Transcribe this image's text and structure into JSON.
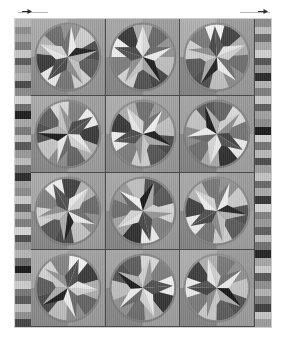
{
  "canvas": {
    "width": 286,
    "height": 346,
    "background": "#ffffff"
  },
  "markers": {
    "left": {
      "name": "scale-arrow-left",
      "x": 18,
      "y": 9,
      "width": 30,
      "color": "#2b2b2b",
      "rule_color": "#b8b8b8"
    },
    "right": {
      "name": "scale-arrow-right",
      "x": 240,
      "y": 9,
      "width": 30,
      "color": "#2b2b2b",
      "rule_color": "#b8b8b8"
    }
  },
  "quilt": {
    "label": "Star Medallion Quilt",
    "x": 14,
    "y": 18,
    "width": 258,
    "height": 310,
    "background": "#9a9a9a",
    "edge_color": "#cfcfcf",
    "sashing_color": "#4a4a4a",
    "rows": 4,
    "cols": 3,
    "border_width": 16,
    "border_left": {
      "name": "pieced-border-left",
      "segments": [
        "#b9b9b9",
        "#8e8e8e",
        "#a6a6a6",
        "#7c7c7c",
        "#c6c6c6",
        "#5c5c5c",
        "#9d9d9d",
        "#b0b0b0",
        "#4a4a4a",
        "#8a8a8a",
        "#d2d2d2",
        "#6e6e6e",
        "#1e1e1e",
        "#a8a8a8",
        "#7a7a7a",
        "#c0c0c0",
        "#575757",
        "#9a9a9a",
        "#bdbdbd",
        "#707070",
        "#2c2c2c",
        "#a0a0a0",
        "#8c8c8c",
        "#cacaca",
        "#636363",
        "#aeaeae",
        "#7f7f7f",
        "#d6d6d6",
        "#4f4f4f",
        "#959595",
        "#b6b6b6",
        "#6a6a6a",
        "#1a1a1a",
        "#a3a3a3",
        "#cdcdcd",
        "#787878",
        "#5a5a5a",
        "#bebebe",
        "#909090",
        "#454545"
      ]
    },
    "border_right": {
      "name": "pieced-border-right",
      "segments": [
        "#8b8b8b",
        "#bdbdbd",
        "#6c6c6c",
        "#a9a9a9",
        "#d0d0d0",
        "#545454",
        "#989898",
        "#2a2a2a",
        "#b4b4b4",
        "#7e7e7e",
        "#c8c8c8",
        "#606060",
        "#a1a1a1",
        "#8d8d8d",
        "#1c1c1c",
        "#cfcfcf",
        "#747474",
        "#b8b8b8",
        "#4c4c4c",
        "#9e9e9e",
        "#c3c3c3",
        "#686868",
        "#aaaaaa",
        "#363636",
        "#d4d4d4",
        "#828282",
        "#9494949",
        "#5f5f5f",
        "#bbbbbb",
        "#717171",
        "#242424",
        "#a6a6a6",
        "#cbcbcb",
        "#595959",
        "#8f8f8f",
        "#b2b2b2",
        "#7b7b7b",
        "#404040",
        "#c5c5c5",
        "#9c9c9c"
      ]
    },
    "blocks": [
      {
        "name": "star-block-r1c1",
        "quadrants": [
          "#a9a9a9",
          "#9d9d9d",
          "#8f8f8f",
          "#9a9a9a"
        ],
        "circle": "#a3a3a3",
        "ring": "#8a8a8a",
        "rotation": 6,
        "wedges": [
          "#5f5f5f",
          "#d9d9d9",
          "#7b7b7b",
          "#f2f2f2",
          "#3a3a3a",
          "#b4b4b4",
          "#6b6b6b",
          "#8f8f8f",
          "#cfcfcf",
          "#4c4c4c"
        ],
        "points": [
          "#6e6e6e",
          "#1f1f1f",
          "#c9c9c9",
          "#4a4a4a",
          "#ededed"
        ]
      },
      {
        "name": "star-block-r1c2",
        "quadrants": [
          "#a4a4a4",
          "#9a9a9a",
          "#8c8c8c",
          "#a0a0a0"
        ],
        "circle": "#a6a6a6",
        "ring": "#868686",
        "rotation": 72,
        "wedges": [
          "#555555",
          "#dcdcdc",
          "#808080",
          "#f4f4f4",
          "#333333",
          "#ababab",
          "#666666",
          "#949494",
          "#c4c4c4",
          "#474747"
        ],
        "points": [
          "#6a6a6a",
          "#1c1c1c",
          "#cccccc",
          "#4f4f4f",
          "#f0f0f0"
        ]
      },
      {
        "name": "star-block-r1c3",
        "quadrants": [
          "#adadad",
          "#989898",
          "#8a8a8a",
          "#9e9e9e"
        ],
        "circle": "#a1a1a1",
        "ring": "#8d8d8d",
        "rotation": 140,
        "wedges": [
          "#5b5b5b",
          "#d5d5d5",
          "#787878",
          "#f6f6f6",
          "#3d3d3d",
          "#b0b0b0",
          "#707070",
          "#909090",
          "#c8c8c8",
          "#515151"
        ],
        "points": [
          "#737373",
          "#222222",
          "#d0d0d0",
          "#454545",
          "#eaeaea"
        ]
      },
      {
        "name": "star-block-r2c1",
        "quadrants": [
          "#a6a6a6",
          "#9c9c9c",
          "#8e8e8e",
          "#a2a2a2"
        ],
        "circle": "#a8a8a8",
        "ring": "#888888",
        "rotation": 200,
        "wedges": [
          "#5d5d5d",
          "#dadada",
          "#7d7d7d",
          "#f1f1f1",
          "#383838",
          "#b6b6b6",
          "#696969",
          "#929292",
          "#cbcbcb",
          "#4e4e4e"
        ],
        "points": [
          "#6c6c6c",
          "#1a1a1a",
          "#c6c6c6",
          "#484848",
          "#efefef"
        ]
      },
      {
        "name": "star-block-r2c2",
        "quadrants": [
          "#aaaaaa",
          "#9f9f9f",
          "#909090",
          "#9b9b9b"
        ],
        "circle": "#a4a4a4",
        "ring": "#8b8b8b",
        "rotation": 40,
        "wedges": [
          "#585858",
          "#d7d7d7",
          "#828282",
          "#f5f5f5",
          "#353535",
          "#aeaeae",
          "#6d6d6d",
          "#969696",
          "#c2c2c2",
          "#4a4a4a"
        ],
        "points": [
          "#6f6f6f",
          "#1e1e1e",
          "#cecece",
          "#525252",
          "#ececec"
        ]
      },
      {
        "name": "star-block-r2c3",
        "quadrants": [
          "#a2a2a2",
          "#969696",
          "#888888",
          "#a5a5a5"
        ],
        "circle": "#9f9f9f",
        "ring": "#848484",
        "rotation": 265,
        "wedges": [
          "#616161",
          "#dddddd",
          "#767676",
          "#f3f3f3",
          "#303030",
          "#b2b2b2",
          "#727272",
          "#8d8d8d",
          "#c6c6c6",
          "#535353"
        ],
        "points": [
          "#686868",
          "#161616",
          "#d2d2d2",
          "#434343",
          "#f1f1f1"
        ]
      },
      {
        "name": "star-block-r3c1",
        "quadrants": [
          "#a8a8a8",
          "#9b9b9b",
          "#8d8d8d",
          "#a1a1a1"
        ],
        "circle": "#a5a5a5",
        "ring": "#898989",
        "rotation": 115,
        "wedges": [
          "#5a5a5a",
          "#d8d8d8",
          "#7f7f7f",
          "#f0f0f0",
          "#3b3b3b",
          "#b3b3b3",
          "#6a6a6a",
          "#919191",
          "#c9c9c9",
          "#4d4d4d"
        ],
        "points": [
          "#717171",
          "#202020",
          "#cacaca",
          "#4b4b4b",
          "#eeeeee"
        ]
      },
      {
        "name": "star-block-r3c2",
        "quadrants": [
          "#a5a5a5",
          "#9e9e9e",
          "#8b8b8b",
          "#9d9d9d"
        ],
        "circle": "#a7a7a7",
        "ring": "#878787",
        "rotation": 310,
        "wedges": [
          "#565656",
          "#dbdbdb",
          "#848484",
          "#f7f7f7",
          "#323232",
          "#a9a9a9",
          "#6f6f6f",
          "#989898",
          "#c0c0c0",
          "#484848"
        ],
        "points": [
          "#656565",
          "#131313",
          "#d4d4d4",
          "#4e4e4e",
          "#e9e9e9"
        ]
      },
      {
        "name": "star-block-r3c3",
        "quadrants": [
          "#abababab",
          "#999999",
          "#898989",
          "#a3a3a3"
        ],
        "circle": "#a0a0a0",
        "ring": "#8c8c8c",
        "rotation": 25,
        "wedges": [
          "#5e5e5e",
          "#d6d6d6",
          "#7a7a7a",
          "#f2f2f2",
          "#3f3f3f",
          "#b7b7b7",
          "#747474",
          "#8e8e8e",
          "#cdcdcd",
          "#505050"
        ],
        "points": [
          "#757575",
          "#242424",
          "#c7c7c7",
          "#464646",
          "#f3f3f3"
        ]
      },
      {
        "name": "star-block-r4c1",
        "quadrants": [
          "#a7a7a7",
          "#9d9d9d",
          "#8f8f8f",
          "#9f9f9f"
        ],
        "circle": "#a2a2a2",
        "ring": "#8a8a8a",
        "rotation": 165,
        "wedges": [
          "#5c5c5c",
          "#d4d4d4",
          "#818181",
          "#f4f4f4",
          "#363636",
          "#b1b1b1",
          "#676767",
          "#939393",
          "#c5c5c5",
          "#4b4b4b"
        ],
        "points": [
          "#6d6d6d",
          "#1d1d1d",
          "#cbcbcb",
          "#4a4a4a",
          "#ebebeb"
        ]
      },
      {
        "name": "star-block-r4c2",
        "quadrants": [
          "#a3a3a3",
          "#9a9a9a",
          "#8c8c8c",
          "#a4a4a4"
        ],
        "circle": "#a9a9a9",
        "ring": "#858585",
        "rotation": 230,
        "wedges": [
          "#595959",
          "#d9d9d9",
          "#7c7c7c",
          "#f5f5f5",
          "#343434",
          "#b5b5b5",
          "#717171",
          "#959595",
          "#c3c3c3",
          "#4f4f4f"
        ],
        "points": [
          "#6b6b6b",
          "#191919",
          "#d1d1d1",
          "#505050",
          "#f0f0f0"
        ]
      },
      {
        "name": "star-block-r4c3",
        "quadrants": [
          "#acacac",
          "#979797",
          "#8a8a8a",
          "#a1a1a1"
        ],
        "circle": "#a4a4a4",
        "ring": "#8e8e8e",
        "rotation": 55,
        "wedges": [
          "#5f5f5f",
          "#d2d2d2",
          "#7e7e7e",
          "#f1f1f1",
          "#393939",
          "#afafaf",
          "#767676",
          "#8f8f8f",
          "#c7c7c7",
          "#525252"
        ],
        "points": [
          "#707070",
          "#151515",
          "#cfcfcf",
          "#444444",
          "#ededed"
        ]
      }
    ]
  }
}
